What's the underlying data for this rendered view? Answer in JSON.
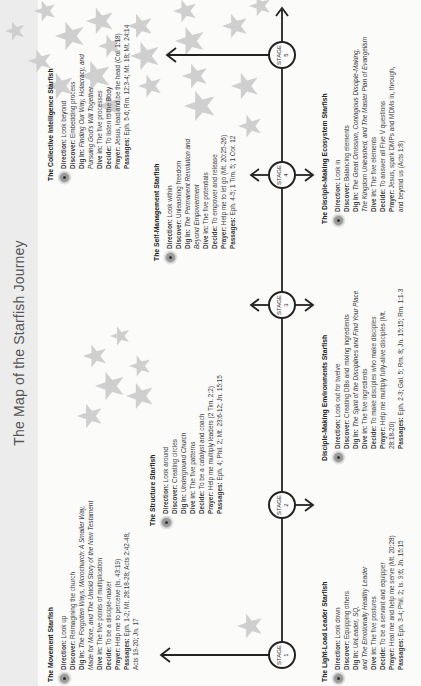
{
  "title": "The Map of the Starfish Journey",
  "stages": [
    {
      "label": "STAGE",
      "number": "1"
    },
    {
      "label": "STAGE",
      "number": "2"
    },
    {
      "label": "STAGE",
      "number": "3"
    },
    {
      "label": "STAGE",
      "number": "4"
    },
    {
      "label": "STAGE",
      "number": "5"
    }
  ],
  "colors": {
    "starfish": "#cfcfcf",
    "line": "#222222",
    "title_band": "#ececec"
  },
  "blocks": {
    "movement": {
      "heading": "The Movement Starfish",
      "direction": [
        "Direction:",
        " Look up"
      ],
      "discover": [
        "Discover:",
        " Reimagining the church"
      ],
      "dig_in_label": "Dig In:",
      "dig_in_1": " The Forgotten Ways, Microchurch: A Smaller Way,",
      "dig_in_2": "Made for More, and The Untold Story of the New Testament",
      "dive_in": [
        "Dive in:",
        " The five points of multiplication"
      ],
      "decide": [
        "Decide:",
        " To be a disciple-maker"
      ],
      "prayer": [
        "Prayer:",
        " Help me to perceive (Is. 43:19)"
      ],
      "passages_label": "Passages:",
      "passages_1": " Eph. 1-2; Mt. 28:18-28; Acts 2:42-48,",
      "passages_2": "Acts 19-20; Jn. 17"
    },
    "structure": {
      "heading": "The Structure Starfish",
      "direction": [
        "Direction:",
        " Look around"
      ],
      "discover": [
        "Discover:",
        " Creating circles"
      ],
      "dig_in": [
        "Dig In:",
        " Underground Church"
      ],
      "dive_in": [
        "Dive in:",
        " The five patterns"
      ],
      "decide": [
        "Decide:",
        " To be a catalyst and coach"
      ],
      "prayer": [
        "Prayer:",
        " Help me multiply leaders (2 Tim. 2:2)"
      ],
      "passages": [
        "Passages:",
        " Eph. 4; Phil. 2; Mt. 23:6-12; Jn. 15:15"
      ]
    },
    "self_management": {
      "heading": "The Self-Management Starfish",
      "direction": [
        "Direction:",
        " Look within"
      ],
      "discover": [
        "Discover:",
        " Unleashing freedom"
      ],
      "dig_in_label": "Dig In:",
      "dig_in_1": " The Permanent Revolution and",
      "dig_in_2": "Beyond Empowerment",
      "dive_in": [
        "Dive in:",
        " The five potentials"
      ],
      "decide": [
        "Decide:",
        " To empower and release"
      ],
      "prayer": [
        "Prayer:",
        " Help me to let go (Mt. 20:25-26)"
      ],
      "passages": [
        "Passages:",
        " Eph. 4-5; 1 Tim. 5; 1 Cor. 12"
      ]
    },
    "collective": {
      "heading": "The Collective Intelligence Starfish",
      "direction": [
        "Direction:",
        " Look beyond"
      ],
      "discover": [
        "Discover:",
        " Embedding process"
      ],
      "dig_in_label": "Dig In:",
      "dig_in_1": " Finding Our Way, Holacracy, and",
      "dig_in_2": "Pursuing God's Will Together",
      "dive_in": [
        "Dive in:",
        " The five processes"
      ],
      "decide": [
        "Decide:",
        " To listen to the Body"
      ],
      "prayer": [
        "Prayer:",
        " Jesus, lead and be the head (Col. 1:18)"
      ],
      "passages": [
        "Passages:",
        " Eph. 5-6; Rm. 12:3-4; Mt. 18; Mt. 24:14"
      ]
    },
    "light_load": {
      "heading": "The Light-Load Leader Starfish",
      "direction": [
        "Direction:",
        " Look down"
      ],
      "discover": [
        "Discover:",
        " Equipping others"
      ],
      "dig_in": [
        "Dig In:",
        " UnLeader, SQ,"
      ],
      "dig_in_2": "and The Emotionally Healthy Leader",
      "dive_in": [
        "Dive in:",
        " The five postures"
      ],
      "decide": [
        "Decide:",
        " To be a servant and equipper"
      ],
      "prayer": [
        "Prayer:",
        " Heal me and help me serve (Mt. 20:28)"
      ],
      "passages": [
        "Passages:",
        " Eph. 3-4; Phil. 2; Is. 9:6; Jn. 15:15"
      ]
    },
    "environments": {
      "heading": "Disciple-Making Environments Starfish",
      "direction": [
        "Direction:",
        " Look out for twelve"
      ],
      "discover": [
        "Discover:",
        " Creating DBs and mixing ingredients"
      ],
      "dig_in_label": "Dig In:",
      "dig_in_1": " The Spirit of the Disciplines and Find Your Place",
      "dive_in": [
        "Dive in:",
        " The five ingredients"
      ],
      "decide": [
        "Decide:",
        " To make disciples who make disciples"
      ],
      "prayer_1": " Help me multiply fully-alive disciples (Mt.",
      "prayer_label": "Prayer:",
      "prayer_2": "28:18-20)",
      "passages": [
        "Passages:",
        " Eph. 2-3; Gal. 5; Rm. 8; Jn. 15:15; Rm. 1:1-3"
      ]
    },
    "ecosystem": {
      "heading": "The Disciple-Making Ecosystem Starfish",
      "direction": [
        "Direction:",
        " Look in"
      ],
      "discover": [
        "Discover:",
        " Balancing elements"
      ],
      "dig_in_label": "Dig In:",
      "dig_in_1": " The Great Omission, Contagious Disciple-Making,",
      "dig_in_2": "The Kingdom Unleashed, and The Master Plan of Evangelism",
      "dive_in": [
        "Dive in:",
        " The five elements"
      ],
      "decide": [
        "Decide:",
        " To answer all Five V questions"
      ],
      "prayer_label": "Prayer:",
      "prayer_1": " Jesus, spark DMPs and MDMs in, through,",
      "prayer_2": "and beyond us (Acts 1:8)"
    }
  }
}
